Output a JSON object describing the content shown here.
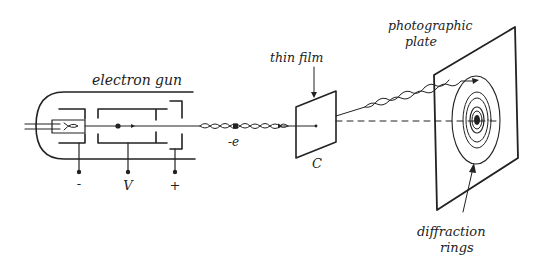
{
  "diagram": {
    "labels": {
      "electron_gun": "electron gun",
      "cathode_terminal": "-",
      "voltage_terminal": "V",
      "anode_terminal": "+",
      "electron": "-e",
      "thin_film": "thin film",
      "film_label": "C",
      "photographic_plate_line1": "photographic",
      "photographic_plate_line2": "plate",
      "diffraction_rings_line1": "diffraction",
      "diffraction_rings_line2": "rings"
    },
    "colors": {
      "ink": "#222222",
      "background": "#ffffff"
    }
  }
}
